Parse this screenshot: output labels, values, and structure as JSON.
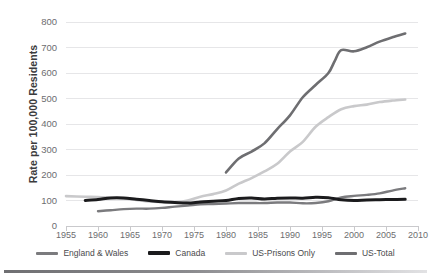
{
  "chart_data": {
    "type": "line",
    "title": "",
    "xlabel": "",
    "ylabel": "Rate per 100,000 Residents",
    "xlim": [
      1955,
      2010
    ],
    "ylim": [
      0,
      800
    ],
    "grid": true,
    "legend_position": "bottom",
    "y_ticks": [
      800,
      700,
      600,
      500,
      400,
      300,
      200,
      100,
      0
    ],
    "x_ticks": [
      1955,
      1960,
      1965,
      1970,
      1975,
      1980,
      1985,
      1990,
      1995,
      2000,
      2005,
      2010
    ],
    "series": [
      {
        "name": "England & Wales",
        "color": "#7b7b7e",
        "width": 2.4,
        "x": [
          1960,
          1962,
          1964,
          1966,
          1968,
          1970,
          1972,
          1974,
          1976,
          1978,
          1980,
          1982,
          1984,
          1986,
          1988,
          1990,
          1992,
          1994,
          1996,
          1998,
          2000,
          2002,
          2004,
          2006,
          2008
        ],
        "values": [
          58,
          62,
          66,
          68,
          68,
          71,
          76,
          80,
          85,
          86,
          88,
          90,
          90,
          90,
          92,
          92,
          89,
          90,
          97,
          112,
          118,
          122,
          128,
          139,
          148
        ]
      },
      {
        "name": "Canada",
        "color": "#1b1b1d",
        "width": 3.0,
        "x": [
          1958,
          1960,
          1962,
          1964,
          1966,
          1968,
          1970,
          1972,
          1974,
          1976,
          1978,
          1980,
          1982,
          1984,
          1986,
          1988,
          1990,
          1992,
          1994,
          1996,
          1998,
          2000,
          2002,
          2004,
          2006,
          2008
        ],
        "values": [
          100,
          104,
          110,
          110,
          105,
          100,
          95,
          92,
          90,
          94,
          97,
          100,
          108,
          110,
          106,
          109,
          110,
          109,
          113,
          111,
          103,
          100,
          102,
          103,
          104,
          105
        ]
      },
      {
        "name": "US-Prisons Only",
        "color": "#c9c9cb",
        "width": 2.6,
        "x": [
          1955,
          1958,
          1960,
          1962,
          1964,
          1966,
          1968,
          1970,
          1972,
          1974,
          1976,
          1978,
          1980,
          1982,
          1984,
          1986,
          1988,
          1990,
          1992,
          1994,
          1996,
          1998,
          2000,
          2002,
          2004,
          2006,
          2008
        ],
        "values": [
          117,
          115,
          114,
          111,
          108,
          102,
          96,
          94,
          93,
          100,
          115,
          125,
          139,
          166,
          188,
          214,
          244,
          292,
          330,
          389,
          427,
          458,
          470,
          476,
          486,
          492,
          496
        ]
      },
      {
        "name": "US-Total",
        "color": "#6e6e71",
        "width": 2.6,
        "x": [
          1980,
          1982,
          1984,
          1986,
          1988,
          1990,
          1992,
          1994,
          1996,
          1997,
          1998,
          2000,
          2002,
          2004,
          2006,
          2008
        ],
        "values": [
          210,
          265,
          292,
          324,
          380,
          434,
          505,
          553,
          600,
          648,
          690,
          685,
          701,
          723,
          740,
          755
        ]
      }
    ]
  },
  "axis": {
    "y_title": "Rate per 100,000 Residents"
  },
  "legend": {
    "items": [
      {
        "label": "England & Wales",
        "color": "#7b7b7e",
        "thickness": "3px"
      },
      {
        "label": "Canada",
        "color": "#1b1b1d",
        "thickness": "4px"
      },
      {
        "label": "US-Prisons Only",
        "color": "#c9c9cb",
        "thickness": "3px"
      },
      {
        "label": "US-Total",
        "color": "#6e6e71",
        "thickness": "3px"
      }
    ]
  }
}
